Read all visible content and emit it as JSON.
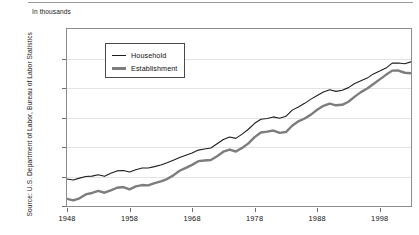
{
  "units_label": "In thousands",
  "source_note": "Source: U.S. Department of Labor, Bureau of Labor Statistics",
  "legend": {
    "household_label": "Household",
    "establishment_label": "Establishment"
  },
  "colors": {
    "household_line": "#1e1e1e",
    "establishment_line": "#7d7d7d",
    "axis": "#8d8d8d",
    "grid": "#e3e3e3",
    "text": "#111111",
    "background": "#ffffff"
  },
  "chart_data": {
    "type": "line",
    "title": "",
    "xlabel": "",
    "ylabel": "In thousands",
    "grid": true,
    "legend_position": "inside-top-left",
    "xlim": [
      1948,
      2003
    ],
    "ylim": [
      40000,
      160000
    ],
    "ytick_labels": [
      "160,000",
      "140,000",
      "120,000",
      "100,000",
      "80,000",
      "60,000",
      "40,000"
    ],
    "ytick_values": [
      160000,
      140000,
      120000,
      100000,
      80000,
      60000,
      40000
    ],
    "xtick_labels": [
      "1948",
      "1958",
      "1968",
      "1978",
      "1988",
      "1998"
    ],
    "xtick_values": [
      1948,
      1958,
      1968,
      1978,
      1988,
      1998
    ],
    "x": [
      1948,
      1949,
      1950,
      1951,
      1952,
      1953,
      1954,
      1955,
      1956,
      1957,
      1958,
      1959,
      1960,
      1961,
      1962,
      1963,
      1964,
      1965,
      1966,
      1967,
      1968,
      1969,
      1970,
      1971,
      1972,
      1973,
      1974,
      1975,
      1976,
      1977,
      1978,
      1979,
      1980,
      1981,
      1982,
      1983,
      1984,
      1985,
      1986,
      1987,
      1988,
      1989,
      1990,
      1991,
      1992,
      1993,
      1994,
      1995,
      1996,
      1997,
      1998,
      1999,
      2000,
      2001,
      2002,
      2003
    ],
    "series": [
      {
        "name": "Household",
        "values": [
          58343,
          57651,
          58918,
          59961,
          60250,
          61179,
          60109,
          62170,
          63799,
          64071,
          63036,
          64630,
          65778,
          65746,
          66702,
          67762,
          69305,
          71088,
          72895,
          74372,
          75920,
          77902,
          78678,
          79367,
          82153,
          85064,
          86794,
          85846,
          88752,
          92017,
          96048,
          98824,
          99303,
          100397,
          99526,
          100834,
          105005,
          107150,
          109597,
          112440,
          114968,
          117342,
          118793,
          117718,
          118492,
          120259,
          123060,
          124900,
          126708,
          129558,
          131463,
          133488,
          136891,
          136933,
          136485,
          137736
        ]
      },
      {
        "name": "Establishment",
        "values": [
          44891,
          43778,
          45222,
          47849,
          48825,
          50203,
          48990,
          50641,
          52369,
          52853,
          51324,
          53268,
          54189,
          53999,
          55549,
          56653,
          58283,
          60765,
          63901,
          65803,
          67897,
          70384,
          70880,
          71214,
          73675,
          76790,
          78265,
          76945,
          79382,
          82471,
          86697,
          89823,
          90406,
          91152,
          89544,
          90152,
          94408,
          97387,
          99344,
          101958,
          105210,
          107895,
          109419,
          108256,
          108604,
          110713,
          114163,
          117191,
          119608,
          122690,
          125865,
          128916,
          131785,
          131826,
          130341,
          129999
        ]
      }
    ]
  }
}
